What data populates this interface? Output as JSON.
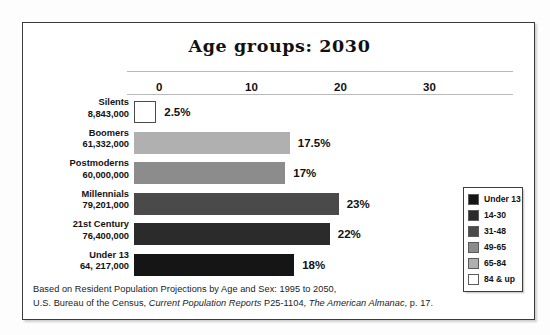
{
  "chart_data": {
    "type": "bar",
    "orientation": "horizontal",
    "title": "Age groups: 2030",
    "xlabel": "",
    "ylabel": "",
    "xlim": [
      0,
      33
    ],
    "grid": false,
    "axis_ticks": [
      "0",
      "10",
      "20",
      "30"
    ],
    "axis_tick_values": [
      0,
      10,
      20,
      30
    ],
    "categories": [
      "Silents",
      "Boomers",
      "Postmoderns",
      "Millennials",
      "21st Century",
      "Under 13"
    ],
    "values": [
      2.5,
      17.5,
      17,
      23,
      22,
      18
    ],
    "value_labels": [
      "2.5%",
      "17.5%",
      "17%",
      "23%",
      "22%",
      "18%"
    ],
    "populations": [
      "8,843,000",
      "61,332,000",
      "60,000,000",
      "79,201,000",
      "76,400,000",
      "64, 217,000"
    ],
    "bar_colors": [
      "#ffffff",
      "#b0b0b0",
      "#8c8c8c",
      "#4a4a4a",
      "#2b2b2b",
      "#151515"
    ],
    "legend_position": "right",
    "legend": {
      "entries": [
        {
          "label": "Under 13",
          "color": "#151515"
        },
        {
          "label": "14-30",
          "color": "#2b2b2b"
        },
        {
          "label": "31-48",
          "color": "#4a4a4a"
        },
        {
          "label": "49-65",
          "color": "#8c8c8c"
        },
        {
          "label": "65-84",
          "color": "#b0b0b0"
        },
        {
          "label": "84 & up",
          "color": "#ffffff"
        }
      ]
    },
    "bars": [
      {
        "category": "Silents",
        "population": "8,843,000",
        "value": 2.5,
        "value_label": "2.5%",
        "color": "#ffffff"
      },
      {
        "category": "Boomers",
        "population": "61,332,000",
        "value": 17.5,
        "value_label": "17.5%",
        "color": "#b0b0b0"
      },
      {
        "category": "Postmoderns",
        "population": "60,000,000",
        "value": 17,
        "value_label": "17%",
        "color": "#8c8c8c"
      },
      {
        "category": "Millennials",
        "population": "79,201,000",
        "value": 23,
        "value_label": "23%",
        "color": "#4a4a4a"
      },
      {
        "category": "21st Century",
        "population": "76,400,000",
        "value": 22,
        "value_label": "22%",
        "color": "#2b2b2b"
      },
      {
        "category": "Under 13",
        "population": "64, 217,000",
        "value": 18,
        "value_label": "18%",
        "color": "#151515"
      }
    ]
  },
  "footnote": {
    "line1": "Based on Resident Population Projections by Age and Sex: 1995 to 2050,",
    "line2_part1": "U.S. Bureau of the Census, ",
    "line2_italic1": "Current Population Reports",
    "line2_part2": " P25-1104, ",
    "line2_italic2": "The American Almanac",
    "line2_part3": ", p. 17."
  }
}
